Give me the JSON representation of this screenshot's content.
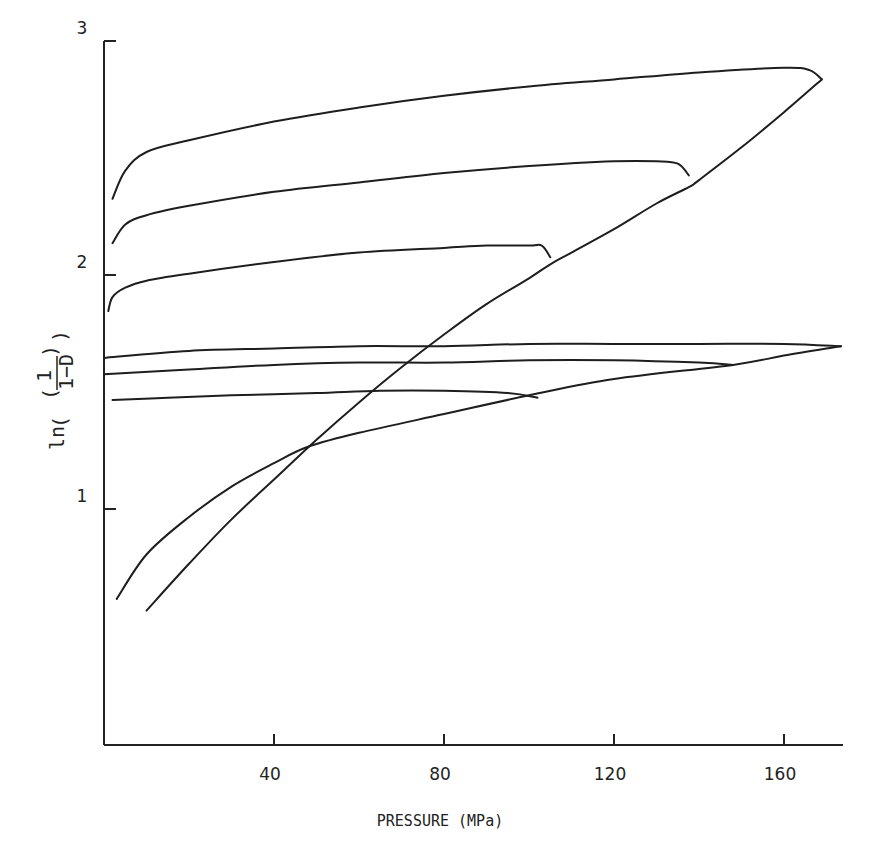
{
  "chart_data": {
    "type": "line",
    "title": "",
    "xlabel": "PRESSURE (MPa)",
    "ylabel": "ln(1/(1-D))",
    "xlim": [
      0,
      174
    ],
    "ylim": [
      0,
      3
    ],
    "grid": false,
    "legend": null,
    "x_ticks": [
      40,
      80,
      120,
      160
    ],
    "y_ticks": [
      1,
      2,
      3
    ],
    "x_tick_labels": [
      "40",
      "80",
      "120",
      "160"
    ],
    "y_tick_labels": [
      "1",
      "2",
      "3"
    ],
    "series": [
      {
        "name": "Curve A (steep loading, upper hysteresis loops)",
        "x": [
          10,
          20,
          30,
          40,
          50,
          60,
          70,
          80,
          90,
          100,
          105,
          110,
          120,
          130,
          137.6,
          140,
          150,
          160,
          168.9
        ],
        "y": [
          0.57,
          0.77,
          0.96,
          1.13,
          1.3,
          1.46,
          1.61,
          1.75,
          1.88,
          1.99,
          2.05,
          2.1,
          2.2,
          2.31,
          2.38,
          2.41,
          2.55,
          2.7,
          2.84
        ]
      },
      {
        "name": "Outer unloading loop (peak ~169 MPa)",
        "x": [
          168.9,
          166,
          160,
          140,
          120,
          100,
          80,
          60,
          40,
          20,
          10,
          5,
          2
        ],
        "y": [
          2.84,
          2.88,
          2.89,
          2.87,
          2.84,
          2.81,
          2.77,
          2.72,
          2.66,
          2.58,
          2.53,
          2.45,
          2.33
        ]
      },
      {
        "name": "Middle unloading loop (peak ~138 MPa)",
        "x": [
          137.6,
          135,
          130,
          120,
          100,
          80,
          60,
          40,
          20,
          10,
          5,
          2
        ],
        "y": [
          2.43,
          2.48,
          2.49,
          2.49,
          2.47,
          2.44,
          2.4,
          2.36,
          2.3,
          2.26,
          2.22,
          2.14
        ]
      },
      {
        "name": "Inner unloading loop (peak ~105 MPa)",
        "x": [
          105,
          103,
          100,
          90,
          80,
          60,
          40,
          20,
          10,
          5,
          2,
          1
        ],
        "y": [
          2.08,
          2.13,
          2.13,
          2.13,
          2.12,
          2.1,
          2.06,
          2.01,
          1.98,
          1.95,
          1.91,
          1.85
        ]
      },
      {
        "name": "Curve B (shallow loading, lower loops)",
        "x": [
          3,
          10,
          20,
          30,
          40,
          48,
          60,
          80,
          100,
          120,
          148,
          160,
          173.4
        ],
        "y": [
          0.62,
          0.81,
          0.97,
          1.1,
          1.2,
          1.27,
          1.33,
          1.41,
          1.49,
          1.56,
          1.62,
          1.66,
          1.7
        ]
      },
      {
        "name": "Lower unloading loop (peak ~173 MPa)",
        "x": [
          173.4,
          160,
          140,
          120,
          100,
          80,
          60,
          40,
          20,
          0
        ],
        "y": [
          1.7,
          1.71,
          1.71,
          1.71,
          1.71,
          1.7,
          1.7,
          1.69,
          1.68,
          1.65
        ]
      },
      {
        "name": "Lower unloading loop (peak ~148 MPa)",
        "x": [
          148,
          140,
          120,
          100,
          80,
          60,
          40,
          20,
          0
        ],
        "y": [
          1.62,
          1.63,
          1.64,
          1.64,
          1.63,
          1.63,
          1.62,
          1.6,
          1.58
        ]
      },
      {
        "name": "Lower unloading loop (peak ~102 MPa)",
        "x": [
          102,
          95,
          80,
          65,
          50,
          30,
          15,
          2
        ],
        "y": [
          1.48,
          1.5,
          1.51,
          1.51,
          1.5,
          1.49,
          1.48,
          1.47
        ]
      }
    ]
  }
}
